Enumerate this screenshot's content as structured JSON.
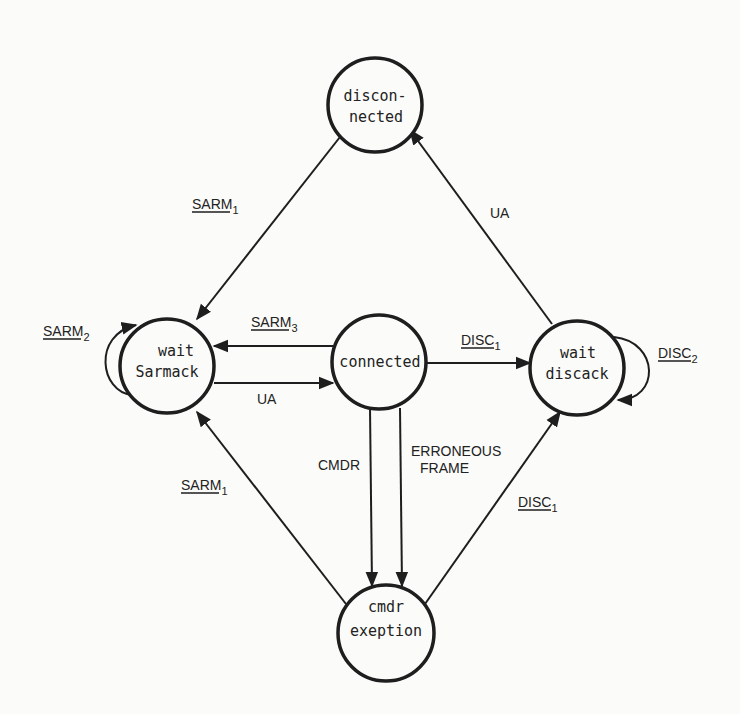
{
  "diagram": {
    "type": "state-transition",
    "colors": {
      "background": "#fbfbf9",
      "ink": "#1e1e1e"
    },
    "states": [
      {
        "id": "disconnected",
        "lines": [
          "discon-",
          "nected"
        ],
        "cx": 375,
        "cy": 105,
        "r": 47
      },
      {
        "id": "wait_sarmack",
        "lines": [
          "wait",
          "Sarmack"
        ],
        "cx": 167,
        "cy": 366,
        "r": 47
      },
      {
        "id": "connected",
        "lines": [
          "connected"
        ],
        "cx": 379,
        "cy": 362,
        "r": 47
      },
      {
        "id": "wait_discack",
        "lines": [
          "wait",
          "discack"
        ],
        "cx": 577,
        "cy": 368,
        "r": 47
      },
      {
        "id": "cmdr_exeption",
        "lines": [
          "cmdr",
          "exeption"
        ],
        "cx": 386,
        "cy": 633,
        "r": 48
      }
    ],
    "transitions": [
      {
        "id": "t1",
        "from": "disconnected",
        "to": "wait_sarmack",
        "label": "SARM",
        "sub": "1",
        "underline": true
      },
      {
        "id": "t2",
        "from": "wait_sarmack",
        "to": "wait_sarmack",
        "label": "SARM",
        "sub": "2",
        "underline": true
      },
      {
        "id": "t3",
        "from": "connected",
        "to": "wait_sarmack",
        "label": "SARM",
        "sub": "3",
        "underline": true
      },
      {
        "id": "t4",
        "from": "wait_sarmack",
        "to": "connected",
        "label": "UA",
        "sub": "",
        "underline": false
      },
      {
        "id": "t5",
        "from": "connected",
        "to": "wait_discack",
        "label": "DISC",
        "sub": "1",
        "underline": true
      },
      {
        "id": "t6",
        "from": "wait_discack",
        "to": "wait_discack",
        "label": "DISC",
        "sub": "2",
        "underline": true
      },
      {
        "id": "t7",
        "from": "wait_discack",
        "to": "disconnected",
        "label": "UA",
        "sub": "",
        "underline": false
      },
      {
        "id": "t8",
        "from": "connected",
        "to": "cmdr_exeption",
        "label": "CMDR",
        "sub": "",
        "underline": false
      },
      {
        "id": "t9",
        "from": "connected",
        "to": "cmdr_exeption",
        "label": "ERRONEOUS",
        "label2": "FRAME",
        "sub": "",
        "underline": false
      },
      {
        "id": "t10",
        "from": "cmdr_exeption",
        "to": "wait_sarmack",
        "label": "SARM",
        "sub": "1",
        "underline": true
      },
      {
        "id": "t11",
        "from": "cmdr_exeption",
        "to": "wait_discack",
        "label": "DISC",
        "sub": "1",
        "underline": true
      }
    ]
  }
}
